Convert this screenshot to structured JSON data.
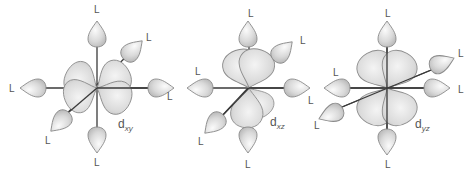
{
  "figure": {
    "ligand_label": "L",
    "colors": {
      "background": "#ffffff",
      "axis": "#3a3a3a",
      "lobe_fill_light": "#f2f2f2",
      "lobe_fill_dark": "#bdbdbd",
      "lobe_stroke": "#8d8d8d",
      "text": "#555555"
    },
    "panels": [
      {
        "id": "dxy",
        "orbital_label": {
          "main": "d",
          "sub": "xy"
        },
        "center": [
          97,
          88
        ],
        "ligand_labels": [
          "L",
          "L",
          "L",
          "L",
          "L",
          "L"
        ]
      },
      {
        "id": "dxz",
        "orbital_label": {
          "main": "d",
          "sub": "xz"
        },
        "center": [
          243,
          88
        ],
        "ligand_labels": [
          "L",
          "L",
          "L",
          "L",
          "L",
          "L"
        ]
      },
      {
        "id": "dyz",
        "orbital_label": {
          "main": "d",
          "sub": "yz"
        },
        "center": [
          385,
          88
        ],
        "ligand_labels": [
          "L",
          "L",
          "L",
          "L",
          "L",
          "L"
        ]
      }
    ]
  }
}
